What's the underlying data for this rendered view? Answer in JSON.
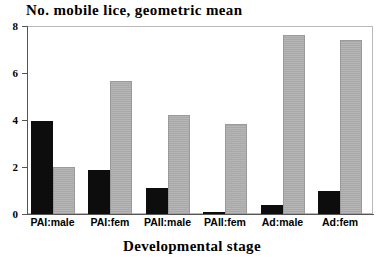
{
  "chart_data": {
    "type": "bar",
    "title": "No. mobile lice, geometric mean",
    "xlabel": "Developmental stage",
    "ylabel": "",
    "ylim": [
      0,
      8
    ],
    "yticks": [
      0,
      2,
      4,
      6,
      8
    ],
    "grid": false,
    "legend": "none",
    "categories": [
      "PAI:male",
      "PAI:fem",
      "PAII:male",
      "PAII:fem",
      "Ad:male",
      "Ad:fem"
    ],
    "series": [
      {
        "name": "black",
        "color": "#0d0d0d",
        "values": [
          4.0,
          1.9,
          1.1,
          0.1,
          0.4,
          1.0
        ]
      },
      {
        "name": "gray",
        "color": "#a8a8a8",
        "values": [
          2.0,
          5.7,
          4.25,
          3.85,
          7.65,
          7.45
        ]
      }
    ]
  },
  "axis": {
    "y_tick_labels": [
      "8",
      "6",
      "4",
      "2",
      "0"
    ]
  }
}
